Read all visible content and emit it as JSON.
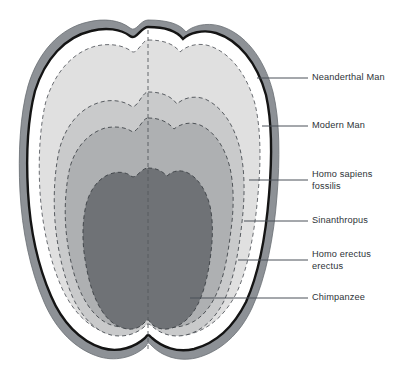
{
  "figure": {
    "background_color": "#ffffff",
    "text_color": "#2e3338",
    "leader_line_color": "#4a5058"
  },
  "layers": [
    {
      "id": "neanderthal",
      "label": "Neanderthal Man",
      "color": "#8d9196",
      "role": "outer-bone-rim"
    },
    {
      "id": "modern-man",
      "label": "Modern Man",
      "color": "#ffffff",
      "role": "inner-vault-gap"
    },
    {
      "id": "homo-sapiens-fossilis",
      "label": "Homo sapiens\nfossilis",
      "color": "#e0e0e0",
      "role": "contour-band"
    },
    {
      "id": "sinanthropus",
      "label": "Sinanthropus",
      "color": "#c9cacb",
      "role": "contour-band"
    },
    {
      "id": "homo-erectus-erectus",
      "label": "Homo erectus\nerectus",
      "color": "#aeb0b2",
      "role": "contour-band"
    },
    {
      "id": "chimpanzee",
      "label": "Chimpanzee",
      "color": "#6f7276",
      "role": "core-region"
    }
  ],
  "callouts": [
    {
      "id": "neanderthal",
      "label": "Neanderthal Man",
      "text_x": 312,
      "text_y": 72,
      "line_x1": 257,
      "line_y1": 78,
      "line_x2": 308,
      "line_y2": 78
    },
    {
      "id": "modern-man",
      "label": "Modern Man",
      "text_x": 312,
      "text_y": 120,
      "line_x1": 262,
      "line_y1": 126,
      "line_x2": 308,
      "line_y2": 126
    },
    {
      "id": "homo-sapiens-fossilis",
      "label": "Homo sapiens\nfossilis",
      "text_x": 312,
      "text_y": 169,
      "line_x1": 249,
      "line_y1": 180,
      "line_x2": 308,
      "line_y2": 180
    },
    {
      "id": "sinanthropus",
      "label": "Sinanthropus",
      "text_x": 312,
      "text_y": 215,
      "line_x1": 244,
      "line_y1": 221,
      "line_x2": 308,
      "line_y2": 221
    },
    {
      "id": "homo-erectus-erectus",
      "label": "Homo erectus\nerectus",
      "text_x": 312,
      "text_y": 249,
      "line_x1": 238,
      "line_y1": 260,
      "line_x2": 308,
      "line_y2": 260
    },
    {
      "id": "chimpanzee",
      "label": "Chimpanzee",
      "text_x": 312,
      "text_y": 292,
      "line_x1": 190,
      "line_y1": 298,
      "line_x2": 308,
      "line_y2": 298
    }
  ],
  "midline": {
    "id": "sagittal-midline",
    "x": 148,
    "y1": 30,
    "y2": 350,
    "style": "dashed"
  }
}
